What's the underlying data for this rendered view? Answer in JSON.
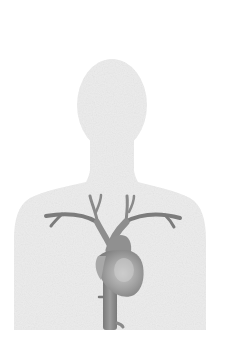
{
  "illustration": {
    "subject": "human-torso-silhouette-with-heart-and-great-vessels",
    "colors": {
      "background": "#ffffff",
      "silhouette": "#ececec",
      "vessel": "#8a8a8a",
      "vessel_dark": "#6f6f6f",
      "heart": "#9a9a9a",
      "heart_highlight": "#c4c4c4"
    },
    "parts": [
      "head",
      "neck",
      "torso",
      "aortic-arch",
      "left-subclavian-artery",
      "right-subclavian-artery",
      "carotid-arteries",
      "heart",
      "descending-aorta"
    ]
  }
}
